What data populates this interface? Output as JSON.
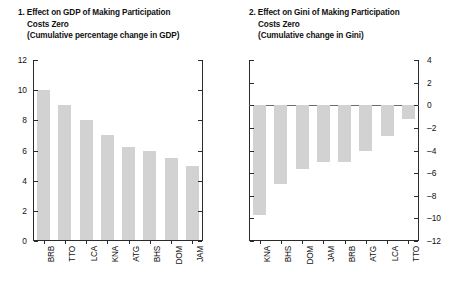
{
  "figure": {
    "background": "#ffffff",
    "bar_color": "#d2d2d2",
    "axis_color": "#2a2a2a"
  },
  "panels": [
    {
      "number": "1.",
      "title_line1": "1. Effect on GDP of Making Participation",
      "title_line2": "Costs Zero",
      "title_line3": "(Cumulative percentage change in GDP)"
    },
    {
      "number": "2.",
      "title_line1": "2. Effect on Gini of Making Participation",
      "title_line2": "Costs Zero",
      "title_line3": "(Cumulative change in Gini)"
    }
  ],
  "chart_data": [
    {
      "type": "bar",
      "title": "1. Effect on GDP of Making Participation Costs Zero",
      "subtitle": "(Cumulative percentage change in GDP)",
      "xlabel": "",
      "ylabel": "",
      "ylim": [
        0,
        12
      ],
      "yticks": [
        0,
        2,
        4,
        6,
        8,
        10,
        12
      ],
      "ytick_labels": [
        "0",
        "2",
        "4",
        "6",
        "8",
        "10",
        "12"
      ],
      "grid": false,
      "legend": "none",
      "axis_side": "left",
      "categories": [
        "BRB",
        "TTO",
        "LCA",
        "KNA",
        "ATG",
        "BHS",
        "DOM",
        "JAM"
      ],
      "values": [
        10.0,
        9.0,
        8.0,
        7.0,
        6.2,
        6.0,
        5.5,
        5.0
      ]
    },
    {
      "type": "bar",
      "title": "2. Effect on Gini of Making Participation Costs Zero",
      "subtitle": "(Cumulative change in Gini)",
      "xlabel": "",
      "ylabel": "",
      "ylim": [
        -12,
        4
      ],
      "yticks": [
        4,
        2,
        0,
        -2,
        -4,
        -6,
        -8,
        -10,
        -12
      ],
      "ytick_labels": [
        "4",
        "2",
        "0",
        "–2",
        "–4",
        "–6",
        "–8",
        "–10",
        "–12"
      ],
      "grid": false,
      "legend": "none",
      "axis_side": "right",
      "categories": [
        "KNA",
        "BHS",
        "DOM",
        "JAM",
        "BRB",
        "ATG",
        "LCA",
        "TTO"
      ],
      "values": [
        -9.7,
        -7.0,
        -5.6,
        -5.0,
        -5.0,
        -4.0,
        -2.7,
        -1.2
      ]
    }
  ]
}
